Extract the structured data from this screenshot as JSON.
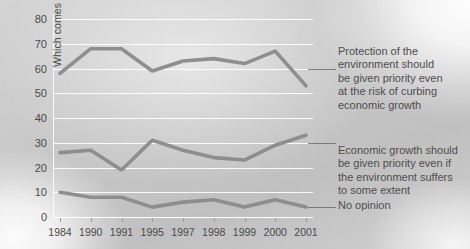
{
  "chart_data": {
    "type": "line",
    "title": "",
    "subtitle": "",
    "xlabel": "",
    "ylabel": "Which comes closer to your view?",
    "categories": [
      "1984",
      "1990",
      "1991",
      "1995",
      "1997",
      "1998",
      "1999",
      "2000",
      "2001"
    ],
    "x": [
      1984,
      1990,
      1991,
      1995,
      1997,
      1998,
      1999,
      2000,
      2001
    ],
    "ylim": [
      0,
      80
    ],
    "xlim": [
      0,
      8
    ],
    "ytick_labels": [
      "0",
      "10",
      "20",
      "30",
      "40",
      "50",
      "60",
      "70",
      "80"
    ],
    "ytick_values": [
      0,
      10,
      20,
      30,
      40,
      50,
      60,
      70,
      80
    ],
    "grid": true,
    "grid_color": "#ffffff",
    "legend_position": "right-annotations",
    "series": [
      {
        "name": "Protection of the environment should be given priority even at the risk of curbing economic growth",
        "short_name": "Environment priority",
        "color": "#8a8a8a",
        "values": [
          58,
          68,
          68,
          59,
          63,
          64,
          62,
          67,
          53
        ]
      },
      {
        "name": "Economic growth should be given priority even if the environment suffers to some extent",
        "short_name": "Economic growth priority",
        "color": "#8a8a8a",
        "values": [
          26,
          27,
          19,
          31,
          27,
          24,
          23,
          29,
          33
        ]
      },
      {
        "name": "No opinion",
        "short_name": "No opinion",
        "color": "#8a8a8a",
        "values": [
          10,
          8,
          8,
          4,
          6,
          7,
          4,
          7,
          4
        ]
      }
    ]
  },
  "annotations": {
    "top": "Protection of the\nenvironment should\nbe given priority even\nat the risk of curbing\neconomic growth",
    "middle": "Economic growth should\nbe given priority even if\nthe environment suffers\nto some extent",
    "bottom": "No opinion"
  },
  "axis": {
    "y_title": "Which comes closer to your view?"
  },
  "colors": {
    "line": "#8a8a8a",
    "grid": "#ffffff",
    "text": "#4a4a4a",
    "background": "#c8c8c8",
    "leader": "#6e6e6e"
  }
}
